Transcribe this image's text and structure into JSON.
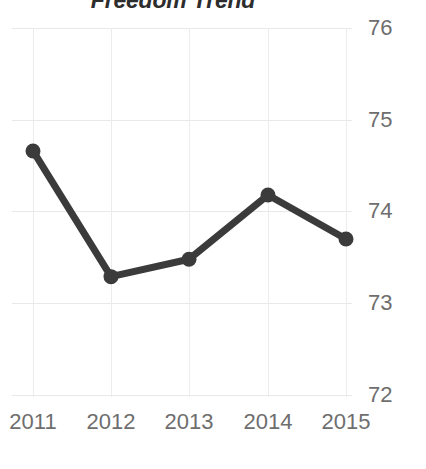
{
  "chart_data": {
    "type": "line",
    "title": "Freedom Trend",
    "xlabel": "",
    "ylabel": "",
    "categories": [
      "2011",
      "2012",
      "2013",
      "2014",
      "2015"
    ],
    "values": [
      74.66,
      73.29,
      73.48,
      74.18,
      73.7
    ],
    "series": [
      {
        "name": "Freedom Trend",
        "values": [
          74.66,
          73.29,
          73.48,
          74.18,
          73.7
        ]
      }
    ],
    "x_tick_labels": [
      "2011",
      "2012",
      "2013",
      "2014",
      "2015"
    ],
    "y_tick_labels": [
      "76",
      "75",
      "74",
      "73",
      "72"
    ],
    "y_ticks": [
      76,
      75,
      74,
      73,
      72
    ],
    "ylim": [
      72,
      76
    ],
    "grid": true,
    "legend": false,
    "legend_position": "none",
    "markers": true,
    "line_color": "#3b3b3b",
    "marker_color": "#3b3b3b",
    "grid_color": "#e8e8e8",
    "tick_label_color": "#6e6e6e",
    "title_color": "#2d2d2d",
    "y_axis_side": "right"
  }
}
